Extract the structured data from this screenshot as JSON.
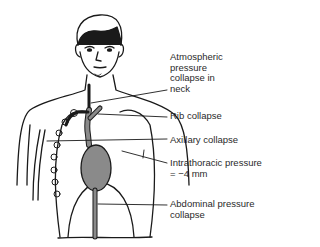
{
  "diagram": {
    "labels": [
      {
        "id": "atmospheric",
        "text": "Atmospheric\npressure\ncollapse in\nneck"
      },
      {
        "id": "rib",
        "text": "Rib collapse"
      },
      {
        "id": "axillary",
        "text": "Axillary collapse"
      },
      {
        "id": "intrathoracic",
        "text": "Intrathoracic pressure\n= −4 mm"
      },
      {
        "id": "abdominal",
        "text": "Abdominal pressure\ncollapse"
      }
    ],
    "colors": {
      "line": "#1a1a1a",
      "vessel_fill": "#8a8a8a",
      "text": "#2a2a2a",
      "background": "#ffffff"
    }
  }
}
